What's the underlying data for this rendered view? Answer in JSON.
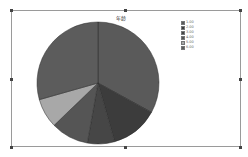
{
  "chart_data": {
    "type": "pie",
    "title": "年龄",
    "categories": [
      "1.00",
      "2.00",
      "3.00",
      "4.00",
      "5.00",
      "6.00"
    ],
    "values": [
      33.0,
      12.6,
      7.2,
      10.0,
      7.8,
      29.4
    ],
    "colors": [
      "#5a5a5a",
      "#3c3c3c",
      "#464646",
      "#555555",
      "#a8a8a8",
      "#5c5c5c"
    ],
    "start_angle": "12 o'clock",
    "direction": "clockwise",
    "legend_position": "top-right"
  },
  "legend": {
    "items": [
      {
        "label": "1.00",
        "color": "#5a5a5a"
      },
      {
        "label": "2.00",
        "color": "#3c3c3c"
      },
      {
        "label": "3.00",
        "color": "#464646"
      },
      {
        "label": "4.00",
        "color": "#555555"
      },
      {
        "label": "5.00",
        "color": "#a8a8a8"
      },
      {
        "label": "6.00",
        "color": "#5c5c5c"
      }
    ]
  }
}
